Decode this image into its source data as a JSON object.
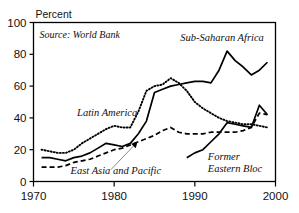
{
  "chart_data": {
    "type": "line",
    "title": "",
    "subtitle": "",
    "xlabel": "",
    "ylabel": "Percent",
    "unit_label": "Percent",
    "source_note": "Source: World Bank",
    "xlim": [
      1970,
      2000
    ],
    "ylim": [
      0,
      100
    ],
    "xticks": [
      1970,
      1980,
      1990,
      2000
    ],
    "yticks": [
      0,
      20,
      40,
      60,
      80,
      100
    ],
    "xtick_labels": [
      "1970",
      "1980",
      "1990",
      "2000"
    ],
    "ytick_labels": [
      "0",
      "20",
      "40",
      "60",
      "80",
      "100"
    ],
    "grid": false,
    "legend": "inline-annotations",
    "series": [
      {
        "name": "Latin America",
        "style": "dotted",
        "color": "#000000",
        "label_x": 1975.4,
        "label_y": 41.5,
        "x": [
          1971,
          1972,
          1973,
          1974,
          1975,
          1976,
          1977,
          1978,
          1979,
          1980,
          1981,
          1982,
          1983,
          1984,
          1985,
          1986,
          1987,
          1988,
          1989,
          1990,
          1991,
          1992,
          1993,
          1994,
          1995,
          1996,
          1997,
          1998,
          1999
        ],
        "values": [
          20,
          19,
          18,
          18,
          20,
          24,
          27,
          30,
          33,
          35,
          34,
          34,
          44,
          57,
          60,
          61,
          65,
          62,
          57,
          50,
          46,
          43,
          40,
          38,
          37,
          36,
          36,
          35,
          34
        ]
      },
      {
        "name": "Sub-Saharan Africa",
        "style": "solid",
        "color": "#000000",
        "label_x": 1988.2,
        "label_y": 88.5,
        "x": [
          1971,
          1972,
          1973,
          1974,
          1975,
          1976,
          1977,
          1978,
          1979,
          1980,
          1981,
          1982,
          1983,
          1984,
          1985,
          1986,
          1987,
          1988,
          1989,
          1990,
          1991,
          1992,
          1993,
          1994,
          1995,
          1996,
          1997,
          1998,
          1999
        ],
        "values": [
          15,
          15,
          14,
          13,
          15,
          16,
          18,
          21,
          24,
          23,
          22,
          24,
          30,
          38,
          56,
          58,
          60,
          61,
          62,
          63,
          63,
          62,
          70,
          82,
          76,
          72,
          67,
          70,
          75
        ]
      },
      {
        "name": "East Asia and Pacific",
        "style": "dashed",
        "color": "#000000",
        "label_x": 1974.6,
        "label_y": 5.0,
        "arrow_from_x": 1979.6,
        "arrow_from_y": 7.5,
        "arrow_to_x": 1982.9,
        "arrow_to_y": 25.0,
        "x": [
          1971,
          1972,
          1973,
          1974,
          1975,
          1976,
          1977,
          1978,
          1979,
          1980,
          1981,
          1982,
          1983,
          1984,
          1985,
          1986,
          1987,
          1988,
          1989,
          1990,
          1991,
          1992,
          1993,
          1994,
          1995,
          1996,
          1997,
          1998,
          1999
        ],
        "values": [
          9,
          9,
          9,
          10,
          12,
          13,
          14,
          16,
          18,
          20,
          21,
          23,
          25,
          27,
          29,
          32,
          34,
          31,
          30,
          30,
          30,
          31,
          31,
          31,
          31,
          32,
          34,
          43,
          42
        ]
      },
      {
        "name": "Former Eastern Bloc",
        "style": "solid",
        "color": "#000000",
        "label_x": 1991.6,
        "label_y": 11.5,
        "label_line_2": "Eastern Bloc",
        "x": [
          1989,
          1990,
          1991,
          1992,
          1993,
          1994,
          1995,
          1996,
          1997,
          1998,
          1999
        ],
        "values": [
          15,
          18,
          20,
          25,
          30,
          37,
          36,
          35,
          34,
          48,
          42
        ]
      }
    ],
    "labels": [
      {
        "text": "Latin America",
        "x": 1975.4,
        "y": 41.5
      },
      {
        "text": "Sub-Saharan Africa",
        "x": 1988.2,
        "y": 88.5
      },
      {
        "text": "East Asia and Pacific",
        "x": 1974.6,
        "y": 5.0
      },
      {
        "text": "Former",
        "x": 1991.6,
        "y": 13.5
      },
      {
        "text": "Eastern Bloc",
        "x": 1991.6,
        "y": 6.0
      }
    ]
  }
}
